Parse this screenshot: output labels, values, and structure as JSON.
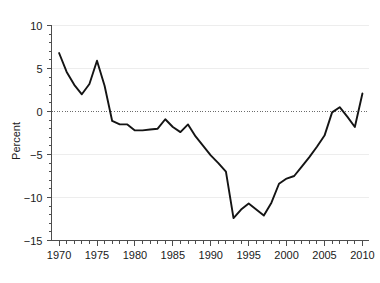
{
  "chart_data": {
    "type": "line",
    "title": "",
    "subtitle": "",
    "xlabel": "",
    "ylabel": "Percent",
    "xlim": [
      1969.0,
      2010.8
    ],
    "ylim": [
      -15,
      10
    ],
    "grid": true,
    "legend": false,
    "legend_position": "none",
    "zero_reference_line": true,
    "line_color": "#141414",
    "grid_color": "#ededed",
    "axis_color": "#4d4d4d",
    "x_tick_labels": [
      "1970",
      "1975",
      "1980",
      "1985",
      "1990",
      "1995",
      "2000",
      "2005",
      "2010"
    ],
    "x_tick_values": [
      1970,
      1975,
      1980,
      1985,
      1990,
      1995,
      2000,
      2005,
      2010
    ],
    "x_minor_tick_step": 1,
    "y_tick_labels": [
      "10",
      "5",
      "0",
      "−5",
      "−10",
      "−15"
    ],
    "y_tick_values": [
      10,
      5,
      0,
      -5,
      -10,
      -15
    ],
    "y_minor_tick_step": 1,
    "x": [
      1970,
      1971,
      1972,
      1973,
      1974,
      1975,
      1976,
      1977,
      1978,
      1979,
      1980,
      1981,
      1982,
      1983,
      1984,
      1985,
      1986,
      1987,
      1988,
      1989,
      1990,
      1991,
      1992,
      1993,
      1994,
      1995,
      1996,
      1997,
      1998,
      1999,
      2000,
      2001,
      2002,
      2003,
      2004,
      2005,
      2006,
      2007,
      2008,
      2009,
      2010
    ],
    "values": [
      6.8,
      4.6,
      3.1,
      2.0,
      3.2,
      5.9,
      3.0,
      -1.1,
      -1.5,
      -1.5,
      -2.2,
      -2.2,
      -2.1,
      -2.0,
      -0.9,
      -1.8,
      -2.4,
      -1.5,
      -2.9,
      -4.0,
      -5.1,
      -6.0,
      -7.0,
      -12.4,
      -11.4,
      -10.7,
      -11.4,
      -12.1,
      -10.6,
      -8.4,
      -7.8,
      -7.5,
      -6.4,
      -5.3,
      -4.1,
      -2.8,
      -0.1,
      0.5,
      -0.6,
      -1.8,
      2.1
    ]
  }
}
